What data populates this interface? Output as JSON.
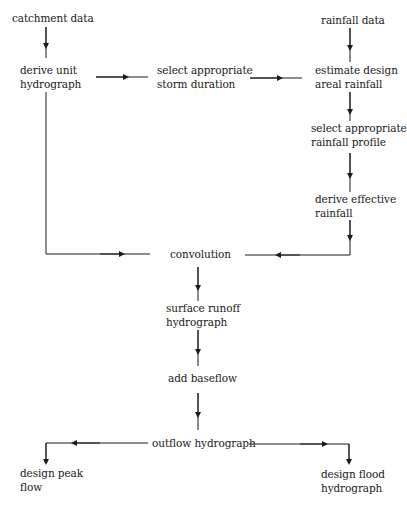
{
  "diagram": {
    "type": "flowchart",
    "colors": {
      "background": "#ffffff",
      "ink": "#1a1a1a"
    },
    "nodes": {
      "catchment_data": {
        "lines": [
          "catchment data"
        ]
      },
      "derive_unit_hydrograph": {
        "lines": [
          "derive unit",
          "hydrograph"
        ]
      },
      "select_storm_duration": {
        "lines": [
          "select appropriate",
          "storm duration"
        ]
      },
      "rainfall_data": {
        "lines": [
          "rainfall data"
        ]
      },
      "estimate_areal_rainfall": {
        "lines": [
          "estimate design",
          "areal rainfall"
        ]
      },
      "select_rainfall_profile": {
        "lines": [
          "select appropriate",
          "rainfall profile"
        ]
      },
      "derive_effective_rainfall": {
        "lines": [
          "derive effective",
          "rainfall"
        ]
      },
      "convolution": {
        "lines": [
          "convolution"
        ]
      },
      "surface_runoff_hydrograph": {
        "lines": [
          "surface runoff",
          "hydrograph"
        ]
      },
      "add_baseflow": {
        "lines": [
          "add baseflow"
        ]
      },
      "outflow_hydrograph": {
        "lines": [
          "outflow hydrograph"
        ]
      },
      "design_peak_flow": {
        "lines": [
          "design peak",
          "flow"
        ]
      },
      "design_flood_hydrograph": {
        "lines": [
          "design flood",
          "hydrograph"
        ]
      }
    },
    "edges": [
      {
        "from": "catchment data",
        "to": "derive unit hydrograph"
      },
      {
        "from": "derive unit hydrograph",
        "to": "select appropriate storm duration"
      },
      {
        "from": "select appropriate storm duration",
        "to": "estimate design areal rainfall"
      },
      {
        "from": "rainfall data",
        "to": "estimate design areal rainfall"
      },
      {
        "from": "estimate design areal rainfall",
        "to": "select appropriate rainfall profile"
      },
      {
        "from": "select appropriate rainfall profile",
        "to": "derive effective rainfall"
      },
      {
        "from": "derive unit hydrograph",
        "to": "convolution"
      },
      {
        "from": "derive effective rainfall",
        "to": "convolution"
      },
      {
        "from": "convolution",
        "to": "surface runoff hydrograph"
      },
      {
        "from": "surface runoff hydrograph",
        "to": "add baseflow"
      },
      {
        "from": "add baseflow",
        "to": "outflow hydrograph"
      },
      {
        "from": "outflow hydrograph",
        "to": "design peak flow"
      },
      {
        "from": "outflow hydrograph",
        "to": "design flood hydrograph"
      }
    ]
  }
}
